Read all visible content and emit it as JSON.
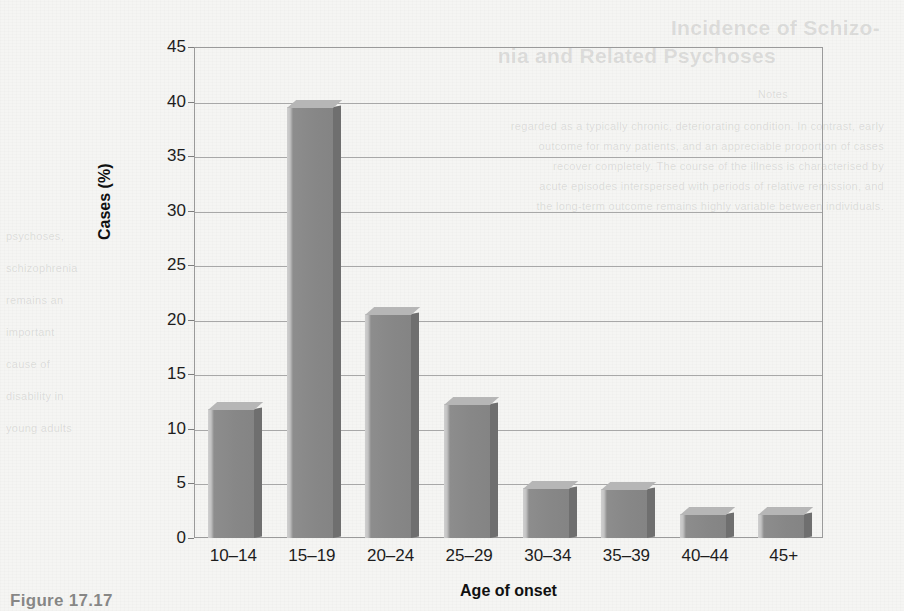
{
  "page": {
    "background_color": "#f5f5f3",
    "ghost_text": {
      "title_line_1": "Incidence of Schizo-",
      "title_line_2": "nia and Related Psychoses",
      "line_a": "Notes",
      "line_b": "regarded as a typically chronic, deteriorating condition. In contrast, early",
      "line_c": "outcome for many patients, and an appreciable proportion of cases",
      "line_d": "recover completely. The course of the illness is characterised by",
      "line_e": "acute episodes interspersed with periods of relative remission, and",
      "line_f": "the long-term outcome remains highly variable between individuals.",
      "left_a": "psychoses,",
      "left_b": "schizophrenia",
      "left_c": "remains an",
      "left_d": "important",
      "left_e": "cause of",
      "left_f": "disability in",
      "left_g": "young adults",
      "caption": "Figure 17.17"
    }
  },
  "chart_data": {
    "type": "bar",
    "title": "",
    "subtitle": "",
    "xlabel": "Age of onset",
    "ylabel": "Cases (%)",
    "categories": [
      "10–14",
      "15–19",
      "20–24",
      "25–29",
      "30–34",
      "35–39",
      "40–44",
      "45+"
    ],
    "values": [
      11.8,
      39.5,
      20.5,
      12.3,
      4.6,
      4.5,
      2.2,
      2.2
    ],
    "series": [
      {
        "name": "Cases (%)",
        "values": [
          11.8,
          39.5,
          20.5,
          12.3,
          4.6,
          4.5,
          2.2,
          2.2
        ]
      }
    ],
    "ylim": [
      0,
      45
    ],
    "yticks": [
      0,
      5,
      10,
      15,
      20,
      25,
      30,
      35,
      40,
      45
    ],
    "ytick_labels": [
      "0",
      "5",
      "10",
      "15",
      "20",
      "25",
      "30",
      "35",
      "40",
      "45"
    ],
    "grid": "horizontal",
    "legend": "none",
    "bar_style": "3d",
    "colors": {
      "bar_front": "#878787",
      "bar_side": "#6f6f6f",
      "bar_top": "#b6b6b6",
      "gridline": "#a8a8a8",
      "frame": "#9a9a9a",
      "text": "#1d1d1d",
      "background": "#f5f5f3"
    }
  }
}
